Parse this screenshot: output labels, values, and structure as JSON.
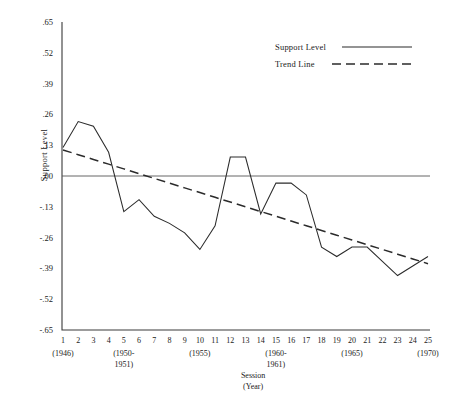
{
  "chart_data": {
    "type": "line",
    "title": "",
    "xlabel": "Session (Year)",
    "ylabel": "Support Level",
    "ylim": [
      -0.65,
      0.65
    ],
    "xlim": [
      1,
      25
    ],
    "grid": false,
    "legend_position": "top-right",
    "x": [
      1,
      2,
      3,
      4,
      5,
      6,
      7,
      8,
      9,
      10,
      11,
      12,
      13,
      14,
      15,
      16,
      17,
      18,
      19,
      20,
      21,
      22,
      23,
      24,
      25
    ],
    "ytick_labels": [
      ".65",
      ".52",
      ".39",
      ".26",
      ".13",
      ".00",
      "-.13",
      "-.26",
      "-.39",
      "-.52",
      "-.65"
    ],
    "ytick_values": [
      0.65,
      0.52,
      0.39,
      0.26,
      0.13,
      0.0,
      -0.13,
      -0.26,
      -0.39,
      -0.52,
      -0.65
    ],
    "xtick_labels": [
      "1",
      "2",
      "3",
      "4",
      "5",
      "6",
      "7",
      "8",
      "9",
      "10",
      "11",
      "12",
      "13",
      "14",
      "15",
      "16",
      "17",
      "18",
      "19",
      "20",
      "21",
      "22",
      "23",
      "24",
      "25"
    ],
    "xyear_annotations": [
      {
        "session": 1,
        "lines": [
          "(1946)"
        ]
      },
      {
        "session": 5,
        "lines": [
          "(1950-",
          "1951)"
        ]
      },
      {
        "session": 10,
        "lines": [
          "(1955)"
        ]
      },
      {
        "session": 15,
        "lines": [
          "(1960-",
          "1961)"
        ]
      },
      {
        "session": 20,
        "lines": [
          "(1965)"
        ]
      },
      {
        "session": 25,
        "lines": [
          "(1970)"
        ]
      }
    ],
    "series": [
      {
        "name": "Support Level",
        "style": "solid",
        "values": [
          0.12,
          0.23,
          0.21,
          0.1,
          -0.15,
          -0.1,
          -0.17,
          -0.2,
          -0.24,
          -0.31,
          -0.21,
          0.08,
          0.08,
          -0.16,
          -0.03,
          -0.03,
          -0.08,
          -0.3,
          -0.34,
          -0.3,
          -0.3,
          -0.36,
          -0.42,
          -0.38,
          -0.34
        ]
      },
      {
        "name": "Trend Line",
        "style": "dashed",
        "values": [
          0.11,
          0.09,
          0.07,
          0.05,
          0.03,
          0.01,
          -0.01,
          -0.03,
          -0.05,
          -0.07,
          -0.09,
          -0.11,
          -0.13,
          -0.15,
          -0.17,
          -0.19,
          -0.21,
          -0.23,
          -0.25,
          -0.27,
          -0.29,
          -0.31,
          -0.33,
          -0.35,
          -0.37
        ]
      }
    ],
    "zero_reference_line": 0.0,
    "colors": {
      "series_solid": "#2b2b2b",
      "series_dashed": "#2b2b2b",
      "axis": "#3a3a3a",
      "zero_line": "#555555",
      "background": "#ffffff"
    }
  },
  "legend": {
    "items": [
      {
        "label": "Support Level",
        "style": "solid"
      },
      {
        "label": "Trend Line",
        "style": "dashed"
      }
    ]
  }
}
